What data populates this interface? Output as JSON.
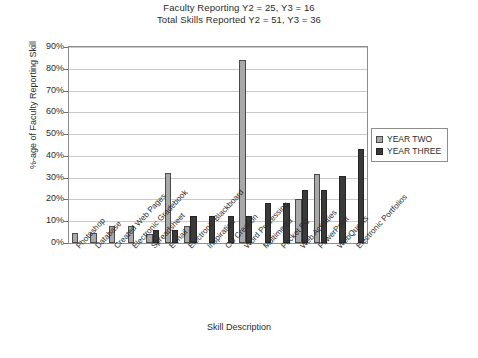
{
  "header": {
    "line1": "Faculty Reporting Y2 = 25, Y3 = 16",
    "line2": "Total Skills Reported Y2 = 51, Y3 = 36"
  },
  "legend": {
    "position": "right",
    "entries": [
      {
        "label": "YEAR TWO",
        "color": "#a8a8a8"
      },
      {
        "label": "YEAR THREE",
        "color": "#3a3a3a"
      }
    ]
  },
  "chart_data": {
    "type": "bar",
    "title": "Faculty Reporting Y2 = 25, Y3 = 16",
    "subtitle": "Total Skills Reported Y2 = 51, Y3 = 36",
    "xlabel": "Skill Description",
    "ylabel": "%-age of Faculty Reporting Skill",
    "ylim": [
      0,
      90
    ],
    "ytick_labels": [
      "0%",
      "10%",
      "20%",
      "30%",
      "40%",
      "50%",
      "60%",
      "70%",
      "80%",
      "90%"
    ],
    "ytick_values": [
      0,
      10,
      20,
      30,
      40,
      50,
      60,
      70,
      80,
      90
    ],
    "grid": true,
    "legend_position": "right",
    "categories": [
      "Photoshop",
      "Database",
      "Created Web Pages",
      "Electronic Gradebook",
      "Spreadsheet",
      "E-mail",
      "Electronic Blackboard",
      "Inspiration",
      "CD Creation",
      "Word Processing",
      "Multimedia",
      "Pocket PC",
      "Web Activities",
      "PowerPoint",
      "WebQuests",
      "Electronic Portfolios"
    ],
    "series": [
      {
        "name": "YEAR TWO",
        "color": "#a8a8a8",
        "values": [
          4.5,
          4.5,
          8,
          8,
          4,
          32,
          8,
          0,
          0,
          84,
          0,
          0,
          20,
          31.5,
          0,
          0
        ]
      },
      {
        "name": "YEAR THREE",
        "color": "#3a3a3a",
        "values": [
          0,
          0,
          0,
          0,
          6,
          6,
          12.5,
          12.5,
          12.5,
          12.5,
          18.5,
          18.5,
          24.5,
          24.5,
          31,
          43
        ]
      }
    ]
  }
}
